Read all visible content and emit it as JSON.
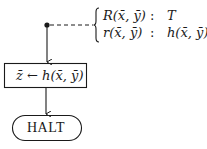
{
  "diagram": {
    "assignment_box": {
      "text": "z̄ ← h(x̄, ȳ)"
    },
    "terminator": {
      "text": "HALT"
    },
    "annotation": {
      "rows": [
        {
          "predicate": "R(x̄, ȳ)",
          "separator": ":",
          "value": "T"
        },
        {
          "predicate": "r(x̄, ȳ)",
          "separator": ":",
          "value": "h(x̄, ȳ)"
        }
      ]
    },
    "colors": {
      "stroke": "#1a1a1a",
      "background": "#ffffff"
    }
  }
}
